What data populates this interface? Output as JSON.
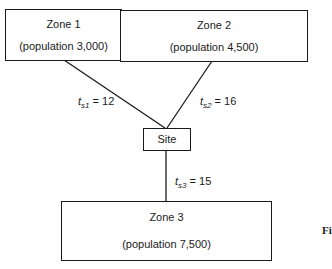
{
  "zones": [
    {
      "name": "Zone  1",
      "population": "(population 3,000)"
    },
    {
      "name": "Zone 2",
      "population": "(population 4,500)"
    },
    {
      "name": "Zone  3",
      "population": "(population 7,500)"
    }
  ],
  "site": {
    "label": "Site"
  },
  "edges": [
    {
      "symbol": "t",
      "sub": "s1",
      "eq": " = 12"
    },
    {
      "symbol": "t",
      "sub": "s2",
      "eq": " = 16"
    },
    {
      "symbol": "t",
      "sub": "s3",
      "eq": " = 15"
    }
  ],
  "caption_fragment": "Fi"
}
